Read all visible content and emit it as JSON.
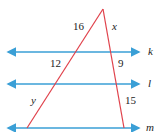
{
  "diagram": {
    "colors": {
      "parallel_lines": "#3a9fd6",
      "transversals": "#e0404a",
      "text": "#222222"
    },
    "parallel_lines": [
      {
        "name": "k",
        "y": 52
      },
      {
        "name": "l",
        "y": 84
      },
      {
        "name": "m",
        "y": 128
      }
    ],
    "segment_labels": {
      "left_top": "16",
      "left_middle": "12",
      "left_bottom": "y",
      "right_top": "x",
      "right_middle": "9",
      "right_bottom": "15"
    },
    "line_labels": {
      "k": "k",
      "l": "l",
      "m": "m"
    }
  }
}
